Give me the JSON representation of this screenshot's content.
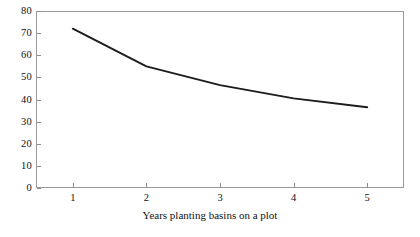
{
  "chart_data": {
    "type": "line",
    "title": "",
    "xlabel": "Years planting basins on a plot",
    "ylabel": "",
    "x": [
      1,
      2,
      3,
      4,
      5
    ],
    "categories": [
      "1",
      "2",
      "3",
      "4",
      "5"
    ],
    "values": [
      72,
      55,
      46.5,
      40.5,
      36.5
    ],
    "series": [
      {
        "name": "",
        "values": [
          72,
          55,
          46.5,
          40.5,
          36.5
        ]
      }
    ],
    "xlim": [
      0.5,
      5.5
    ],
    "ylim": [
      0,
      80
    ],
    "yticks": [
      0,
      10,
      20,
      30,
      40,
      50,
      60,
      70,
      80
    ],
    "ytick_labels": [
      "0",
      "10",
      "20",
      "30",
      "40",
      "50",
      "60",
      "70",
      "80"
    ],
    "xticks": [
      1,
      2,
      3,
      4,
      5
    ],
    "xtick_labels": [
      "1",
      "2",
      "3",
      "4",
      "5"
    ],
    "grid": false,
    "legend": null,
    "legend_position": "none",
    "line_color": "#1c1c1c",
    "frame_color": "#9a9a9a",
    "background_color": "#ffffff"
  }
}
